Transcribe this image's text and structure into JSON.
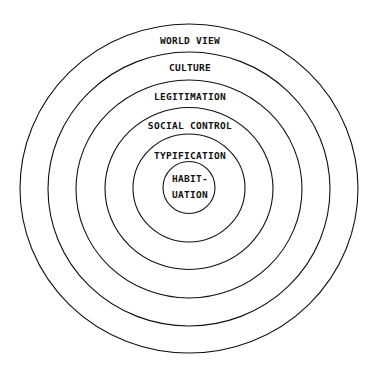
{
  "diagram": {
    "type": "concentric-circles",
    "center": {
      "x": 189,
      "y": 188.5
    },
    "stroke_color": "#111111",
    "background": "#ffffff",
    "layers": [
      {
        "label": "WORLD VIEW",
        "rx": 169,
        "ry": 164.5,
        "label_y": 40
      },
      {
        "label": "CULTURE",
        "rx": 141,
        "ry": 137,
        "label_y": 67
      },
      {
        "label": "LEGITIMATION",
        "rx": 113,
        "ry": 109,
        "label_y": 96
      },
      {
        "label": "SOCIAL CONTROL",
        "rx": 84,
        "ry": 81,
        "label_y": 125
      },
      {
        "label": "TYPIFICATION",
        "rx": 56,
        "ry": 54,
        "label_y": 155
      },
      {
        "label_lines": [
          "HABIT-",
          "UATION"
        ],
        "rx": 26,
        "ry": 26,
        "label_y": [
          178,
          194
        ]
      }
    ],
    "labels": {
      "world_view": "WORLD VIEW",
      "culture": "CULTURE",
      "legitimation": "LEGITIMATION",
      "social_control": "SOCIAL CONTROL",
      "typification": "TYPIFICATION",
      "habituation_line1": "HABIT-",
      "habituation_line2": "UATION"
    }
  }
}
